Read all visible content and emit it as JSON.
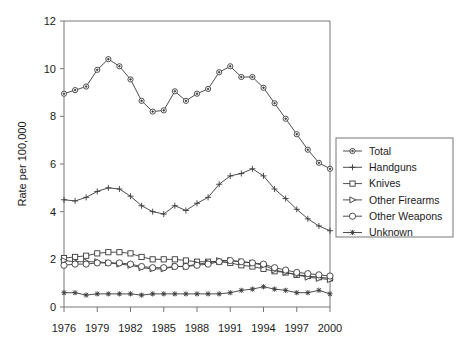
{
  "chart_data": {
    "type": "line",
    "title": "",
    "xlabel": "",
    "ylabel": "Rate per 100,000",
    "xlim": [
      1976,
      2000
    ],
    "ylim": [
      0,
      12
    ],
    "ytick_labels": [
      "0",
      "2",
      "4",
      "6",
      "8",
      "10",
      "12"
    ],
    "ytick_values": [
      0,
      2,
      4,
      6,
      8,
      10,
      12
    ],
    "xtick_labels": [
      "1976",
      "1979",
      "1982",
      "1985",
      "1988",
      "1991",
      "1994",
      "1997",
      "2000"
    ],
    "xtick_values": [
      1976,
      1979,
      1982,
      1985,
      1988,
      1991,
      1994,
      1997,
      2000
    ],
    "grid": false,
    "legend_position": "right",
    "x": [
      1976,
      1977,
      1978,
      1979,
      1980,
      1981,
      1982,
      1983,
      1984,
      1985,
      1986,
      1987,
      1988,
      1989,
      1990,
      1991,
      1992,
      1993,
      1994,
      1995,
      1996,
      1997,
      1998,
      1999,
      2000
    ],
    "series": [
      {
        "name": "Total",
        "marker": "circle-open",
        "values": [
          8.95,
          9.1,
          9.25,
          9.95,
          10.4,
          10.1,
          9.55,
          8.65,
          8.2,
          8.25,
          9.05,
          8.65,
          8.95,
          9.15,
          9.85,
          10.1,
          9.65,
          9.65,
          9.2,
          8.55,
          7.9,
          7.25,
          6.6,
          6.05,
          5.8
        ]
      },
      {
        "name": "Handguns",
        "marker": "plus",
        "values": [
          4.5,
          4.45,
          4.6,
          4.85,
          5.0,
          4.95,
          4.65,
          4.25,
          4.0,
          3.9,
          4.25,
          4.05,
          4.35,
          4.6,
          5.15,
          5.5,
          5.6,
          5.8,
          5.5,
          4.95,
          4.55,
          4.1,
          3.7,
          3.4,
          3.2
        ]
      },
      {
        "name": "Knives",
        "marker": "square-open",
        "values": [
          2.05,
          2.1,
          2.15,
          2.25,
          2.3,
          2.3,
          2.25,
          2.1,
          2.0,
          2.0,
          2.0,
          1.95,
          1.9,
          1.9,
          1.9,
          1.85,
          1.75,
          1.7,
          1.6,
          1.5,
          1.45,
          1.35,
          1.3,
          1.25,
          1.2
        ]
      },
      {
        "name": "Other Firearms",
        "marker": "triangle-open",
        "values": [
          1.95,
          1.9,
          1.9,
          1.9,
          1.85,
          1.8,
          1.75,
          1.65,
          1.6,
          1.6,
          1.7,
          1.7,
          1.8,
          1.85,
          1.95,
          1.95,
          1.9,
          1.85,
          1.75,
          1.55,
          1.45,
          1.35,
          1.25,
          1.2,
          1.15
        ]
      },
      {
        "name": "Other Weapons",
        "marker": "circle-large-open",
        "values": [
          1.75,
          1.8,
          1.8,
          1.85,
          1.85,
          1.85,
          1.8,
          1.7,
          1.65,
          1.65,
          1.7,
          1.7,
          1.75,
          1.8,
          1.9,
          1.95,
          1.9,
          1.85,
          1.8,
          1.65,
          1.55,
          1.45,
          1.4,
          1.35,
          1.3
        ]
      },
      {
        "name": "Unknown",
        "marker": "star",
        "values": [
          0.6,
          0.6,
          0.5,
          0.55,
          0.55,
          0.55,
          0.55,
          0.5,
          0.55,
          0.55,
          0.55,
          0.55,
          0.55,
          0.55,
          0.55,
          0.6,
          0.7,
          0.75,
          0.85,
          0.75,
          0.7,
          0.6,
          0.6,
          0.7,
          0.55
        ]
      }
    ]
  },
  "colors": {
    "line": "#3a3a3a",
    "axis": "#777777",
    "text": "#1a1a1a",
    "background": "#ffffff"
  }
}
